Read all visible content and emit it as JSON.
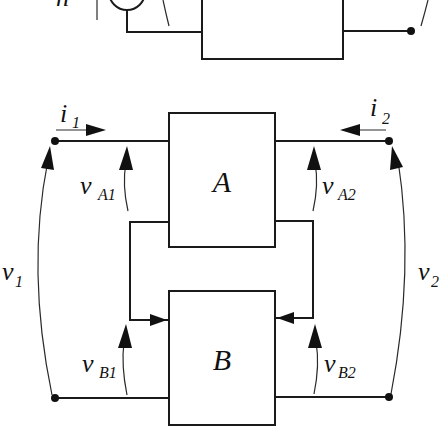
{
  "diagram": {
    "top_partial": {
      "left_label_fragment": "n"
    },
    "blocks": [
      {
        "id": "A",
        "label": "A"
      },
      {
        "id": "B",
        "label": "B"
      }
    ],
    "currents": [
      {
        "main": "i",
        "sub": "1",
        "direction": "right"
      },
      {
        "main": "i",
        "sub": "2",
        "direction": "left"
      }
    ],
    "voltages": {
      "port1": {
        "main": "v",
        "sub": "1"
      },
      "port2": {
        "main": "v",
        "sub": "2"
      },
      "A1": {
        "main": "v",
        "sub": "A1"
      },
      "A2": {
        "main": "v",
        "sub": "A2"
      },
      "B1": {
        "main": "v",
        "sub": "B1"
      },
      "B2": {
        "main": "v",
        "sub": "B2"
      }
    },
    "colors": {
      "line": "#1a1a1a",
      "background": "#ffffff"
    }
  }
}
